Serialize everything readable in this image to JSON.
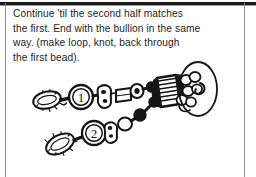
{
  "page": {
    "background_color": "#ffffff",
    "frame_color": "#1b1b1b",
    "frame_edge_color": "#8d8d8d",
    "ink_color": "#1d1d1d"
  },
  "instructions": {
    "lines": [
      "Continue 'til the second half matches",
      "the first. End with the bullion in the same",
      "way. (make loop, knot, back through",
      "the first bead)."
    ],
    "full_text": "Continue 'til the second half matches the first. End with the bullion in the same way. (make loop, knot, back through the first bead)."
  },
  "illustration": {
    "caption": "beaded-strand-diagram",
    "description": "Line drawing of two beaded strands joined at a coiled bullion with a large oval bead",
    "bead_labels": [
      "1",
      "2"
    ],
    "label_1": "1",
    "label_2": "2",
    "stroke_color": "#151515",
    "fill_color": "#ffffff"
  }
}
